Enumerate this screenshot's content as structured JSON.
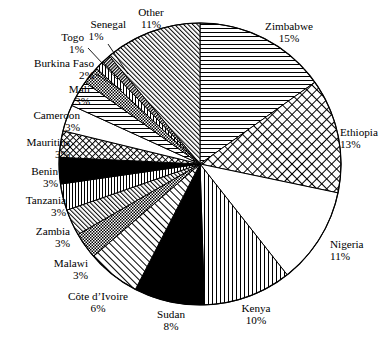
{
  "chart_data": {
    "type": "pie",
    "title": "",
    "subtitle": "",
    "xlabel": "",
    "ylabel": "",
    "legend_position": "none",
    "grid": false,
    "value_unit": "percent",
    "start_angle_deg": 0,
    "direction": "clockwise",
    "categories": [
      "Zimbabwe",
      "Ethiopia",
      "Nigeria",
      "Kenya",
      "Sudan",
      "Côte d’Ivoire",
      "Malawi",
      "Zambia",
      "Tanzania",
      "Benin",
      "Mauritius",
      "Cameroon",
      "Mali",
      "Burkina Faso",
      "Togo",
      "Senegal",
      "Other"
    ],
    "values": [
      15,
      13,
      11,
      10,
      8,
      6,
      3,
      3,
      3,
      3,
      3,
      3,
      3,
      2,
      1,
      1,
      11
    ],
    "slices": [
      {
        "label": "Zimbabwe",
        "value": 15,
        "value_text": "15%",
        "pattern": "horizontal-lines"
      },
      {
        "label": "Ethiopia",
        "value": 13,
        "value_text": "13%",
        "pattern": "crosshatch-diagonal"
      },
      {
        "label": "Nigeria",
        "value": 11,
        "value_text": "11%",
        "pattern": "blank-white"
      },
      {
        "label": "Kenya",
        "value": 10,
        "value_text": "10%",
        "pattern": "vertical-lines"
      },
      {
        "label": "Sudan",
        "value": 8,
        "value_text": "8%",
        "pattern": "solid-black"
      },
      {
        "label": "Côte d’Ivoire",
        "value": 6,
        "value_text": "6%",
        "pattern": "diagonal-lines-up"
      },
      {
        "label": "Malawi",
        "value": 3,
        "value_text": "3%",
        "pattern": "fine-checker"
      },
      {
        "label": "Zambia",
        "value": 3,
        "value_text": "3%",
        "pattern": "diagonal-lines-up"
      },
      {
        "label": "Tanzania",
        "value": 3,
        "value_text": "3%",
        "pattern": "vertical-lines"
      },
      {
        "label": "Benin",
        "value": 3,
        "value_text": "3%",
        "pattern": "solid-black"
      },
      {
        "label": "Mauritius",
        "value": 3,
        "value_text": "3%",
        "pattern": "crosshatch-diagonal"
      },
      {
        "label": "Cameroon",
        "value": 3,
        "value_text": "3%",
        "pattern": "blank-white"
      },
      {
        "label": "Mali",
        "value": 3,
        "value_text": "3%",
        "pattern": "horizontal-lines"
      },
      {
        "label": "Burkina Faso",
        "value": 2,
        "value_text": "2%",
        "pattern": "fine-checker"
      },
      {
        "label": "Togo",
        "value": 1,
        "value_text": "1%",
        "pattern": "vertical-lines"
      },
      {
        "label": "Senegal",
        "value": 1,
        "value_text": "1%",
        "pattern": "dense-diagonal-dark"
      },
      {
        "label": "Other",
        "value": 11,
        "value_text": "11%",
        "pattern": "diagonal-lines-up-dense"
      }
    ]
  },
  "labels": {
    "zimbabwe": {
      "name": "Zimbabwe",
      "pct": "15%"
    },
    "ethiopia": {
      "name": "Ethiopia",
      "pct": "13%"
    },
    "nigeria": {
      "name": "Nigeria",
      "pct": "11%"
    },
    "kenya": {
      "name": "Kenya",
      "pct": "10%"
    },
    "sudan": {
      "name": "Sudan",
      "pct": "8%"
    },
    "cote_divoire": {
      "name": "Côte d’Ivoire",
      "pct": "6%"
    },
    "malawi": {
      "name": "Malawi",
      "pct": "3%"
    },
    "zambia": {
      "name": "Zambia",
      "pct": "3%"
    },
    "tanzania": {
      "name": "Tanzania",
      "pct": "3%"
    },
    "benin": {
      "name": "Benin",
      "pct": "3%"
    },
    "mauritius": {
      "name": "Mauritius",
      "pct": "3%"
    },
    "cameroon": {
      "name": "Cameroon",
      "pct": "3%"
    },
    "mali": {
      "name": "Mali",
      "pct": "3%"
    },
    "burkina_faso": {
      "name": "Burkina Faso",
      "pct": "2%"
    },
    "togo": {
      "name": "Togo",
      "pct": "1%"
    },
    "senegal": {
      "name": "Senegal",
      "pct": "1%"
    },
    "other": {
      "name": "Other",
      "pct": "11%"
    }
  },
  "colors": {
    "stroke": "#000000",
    "fill_black": "#000000",
    "fill_white": "#ffffff",
    "background": "#ffffff"
  }
}
